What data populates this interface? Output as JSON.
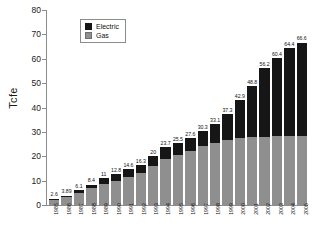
{
  "chart_data": {
    "type": "bar",
    "title": "",
    "subtitle": "",
    "xlabel": "",
    "ylabel": "Tcfe",
    "ylim": [
      0,
      80
    ],
    "yticks": [
      0,
      10,
      20,
      30,
      40,
      50,
      60,
      70,
      80
    ],
    "grid": false,
    "stacked": true,
    "legend_position": "top-left-inside",
    "categories": [
      "1985",
      "1986",
      "1987",
      "1988",
      "1989",
      "1990",
      "1991",
      "1992",
      "1993",
      "1994",
      "1995",
      "1996",
      "1997",
      "1998",
      "1999",
      "2000",
      "2001",
      "2002",
      "2003",
      "2004",
      "2005"
    ],
    "series": [
      {
        "name": "Gas",
        "color": "#8f8f8f",
        "values": [
          2.2,
          3.2,
          5.1,
          6.8,
          8.8,
          10.0,
          11.4,
          13.0,
          16.2,
          19.0,
          20.4,
          22.1,
          24.2,
          25.6,
          26.6,
          27.4,
          27.8,
          28.1,
          28.2,
          28.3,
          28.4
        ]
      },
      {
        "name": "Electric",
        "color": "#161616",
        "values": [
          0.4,
          0.69,
          1.0,
          1.6,
          2.2,
          2.8,
          3.2,
          3.3,
          3.8,
          4.7,
          5.1,
          5.5,
          6.1,
          7.5,
          10.7,
          15.5,
          21.0,
          28.1,
          32.2,
          36.1,
          38.2
        ]
      }
    ],
    "totals": [
      2.6,
      3.89,
      6.1,
      8.4,
      11,
      12.8,
      14.6,
      16.3,
      20,
      23.7,
      25.5,
      27.6,
      30.3,
      33.1,
      37.3,
      42.9,
      48.8,
      56.2,
      60.4,
      64.4,
      66.6
    ],
    "total_labels": [
      "2.6",
      "3.89",
      "6.1",
      "8.4",
      "11",
      "12.8",
      "14.6",
      "16.3",
      "20",
      "23.7",
      "25.5",
      "27.6",
      "30.3",
      "33.1",
      "37.3",
      "42.9",
      "48.8",
      "56.2",
      "60.4",
      "64.4",
      "66.6"
    ],
    "legend": [
      {
        "label": "Electric",
        "color": "#161616"
      },
      {
        "label": "Gas",
        "color": "#8f8f8f"
      }
    ]
  }
}
